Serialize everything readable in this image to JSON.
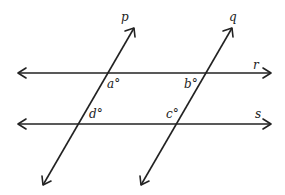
{
  "diagram": {
    "lines": [
      {
        "name": "r",
        "label": "r"
      },
      {
        "name": "s",
        "label": "s"
      },
      {
        "name": "p",
        "label": "p"
      },
      {
        "name": "q",
        "label": "q"
      }
    ],
    "angles": [
      {
        "name": "a",
        "label": "a°"
      },
      {
        "name": "b",
        "label": "b°"
      },
      {
        "name": "c",
        "label": "c°"
      },
      {
        "name": "d",
        "label": "d°"
      }
    ],
    "colors": {
      "stroke": "#222222",
      "background": "#ffffff"
    }
  }
}
